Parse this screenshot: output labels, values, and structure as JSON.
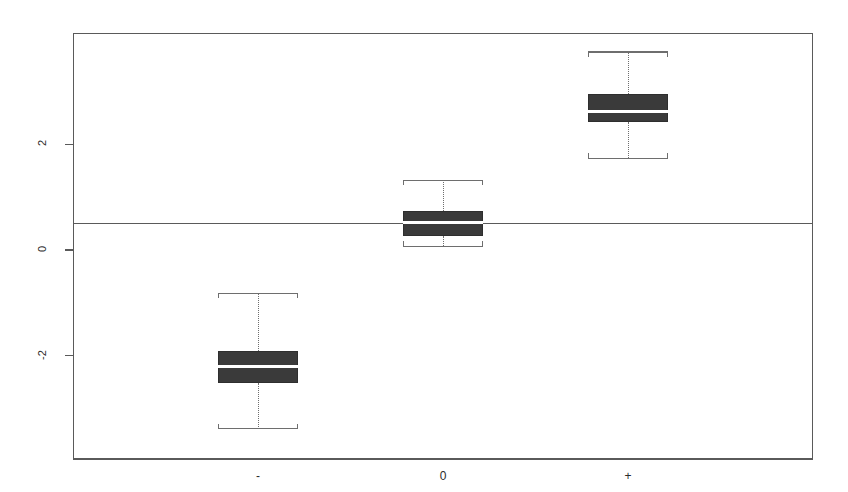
{
  "chart_data": {
    "type": "boxplot",
    "title": "",
    "subtitle": "",
    "xlabel": "",
    "ylabel": "",
    "grid": false,
    "legend": null,
    "xlim": [
      0,
      4
    ],
    "ylim": [
      -3.95,
      4.1
    ],
    "y_ticks": [
      {
        "label": "2",
        "value": 2
      },
      {
        "label": "0",
        "value": 0
      },
      {
        "label": "-2",
        "value": -2
      }
    ],
    "x_ticks": [
      {
        "label": "-",
        "value": 1
      },
      {
        "label": "0",
        "value": 2
      },
      {
        "label": "+",
        "value": 3
      }
    ],
    "categories": [
      "-",
      "0",
      "+"
    ],
    "annotations": [
      {
        "name": "reference-hline",
        "orientation": "horizontal",
        "value": 0.5,
        "style": "solid",
        "color": "#5a5a5a"
      }
    ],
    "boxes": [
      {
        "category": "-",
        "x": 1,
        "whisker_low": -3.38,
        "q1": -2.52,
        "median": -2.21,
        "q3": -1.9,
        "whisker_high": -0.82,
        "outliers": []
      },
      {
        "category": "0",
        "x": 2,
        "whisker_low": 0.07,
        "q1": 0.27,
        "median": 0.51,
        "q3": 0.74,
        "whisker_high": 1.32,
        "outliers": []
      },
      {
        "category": "+",
        "x": 3,
        "whisker_low": 1.73,
        "q1": 2.42,
        "median": 2.61,
        "q3": 2.94,
        "whisker_high": 3.74,
        "outliers": []
      }
    ],
    "style": {
      "box_fill": "#3a3a3a",
      "box_border": "#2e2e2e",
      "median_color": "#ffffff",
      "whisker_color": "#6e6e6e",
      "whisker_style": "dotted",
      "axis_color": "#5a5a5a",
      "background": "#ffffff"
    }
  }
}
